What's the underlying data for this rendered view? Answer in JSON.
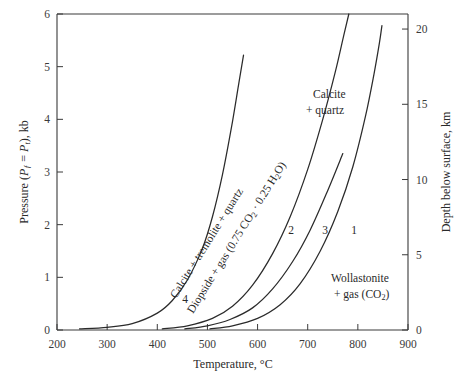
{
  "chart_data": {
    "type": "line",
    "title": "",
    "xlabel": "Temperature, °C",
    "ylabel": "Pressure (Pƒ = Pₜ), kb",
    "y2label": "Depth below surface, km",
    "xlim": [
      200,
      900
    ],
    "ylim": [
      0,
      6
    ],
    "y2lim": [
      0,
      21
    ],
    "xticks": [
      200,
      300,
      400,
      500,
      600,
      700,
      800,
      900
    ],
    "yticks": [
      0,
      1,
      2,
      3,
      4,
      5,
      6
    ],
    "y2ticks": [
      0,
      5,
      10,
      15,
      20
    ],
    "grid": false,
    "legend_position": "inline-annotations",
    "series": [
      {
        "name": "4",
        "label": "4",
        "label_x": 185,
        "label_y": 303,
        "points": [
          [
            245,
            0.02
          ],
          [
            300,
            0.05
          ],
          [
            350,
            0.12
          ],
          [
            400,
            0.32
          ],
          [
            430,
            0.56
          ],
          [
            460,
            0.95
          ],
          [
            490,
            1.55
          ],
          [
            510,
            2.15
          ],
          [
            530,
            2.95
          ],
          [
            548,
            3.85
          ],
          [
            562,
            4.65
          ],
          [
            572,
            5.22
          ]
        ]
      },
      {
        "name": "2",
        "label": "2",
        "label_x": 291,
        "label_y": 234,
        "points": [
          [
            410,
            0.02
          ],
          [
            460,
            0.08
          ],
          [
            510,
            0.22
          ],
          [
            550,
            0.45
          ],
          [
            590,
            0.85
          ],
          [
            630,
            1.45
          ],
          [
            665,
            2.15
          ],
          [
            700,
            3.05
          ],
          [
            730,
            4.0
          ],
          [
            755,
            4.9
          ],
          [
            772,
            5.6
          ],
          [
            782,
            6.0
          ]
        ]
      },
      {
        "name": "3",
        "label": "3",
        "label_x": 325,
        "label_y": 234,
        "points": [
          [
            455,
            0.02
          ],
          [
            500,
            0.08
          ],
          [
            545,
            0.2
          ],
          [
            590,
            0.42
          ],
          [
            630,
            0.78
          ],
          [
            670,
            1.3
          ],
          [
            705,
            1.9
          ],
          [
            740,
            2.65
          ],
          [
            770,
            3.35
          ]
        ]
      },
      {
        "name": "1",
        "label": "1",
        "label_x": 354,
        "label_y": 234,
        "points": [
          [
            505,
            0.02
          ],
          [
            550,
            0.08
          ],
          [
            600,
            0.22
          ],
          [
            645,
            0.48
          ],
          [
            685,
            0.88
          ],
          [
            725,
            1.5
          ],
          [
            760,
            2.25
          ],
          [
            790,
            3.1
          ],
          [
            815,
            4.05
          ],
          [
            832,
            4.85
          ],
          [
            843,
            5.45
          ],
          [
            848,
            5.78
          ]
        ]
      }
    ],
    "annotations": [
      {
        "name": "calcite-tremolite-quartz",
        "text": "Calcite + tremolite + quartz",
        "rotated": true,
        "x": 176,
        "y": 299,
        "angle": -58
      },
      {
        "name": "diopside-gas",
        "text_plain": "Diopside + gas (0.75 CO2 · 0.25 H2O)",
        "parts": [
          "Diopside + gas (0.75 CO",
          "2",
          " · 0.25 H",
          "2",
          "O)"
        ],
        "rotated": true,
        "x": 191,
        "y": 312,
        "angle": -58
      },
      {
        "name": "calcite-quartz",
        "lines": [
          "Calcite",
          "+ quartz"
        ],
        "x": 313,
        "y": 98
      },
      {
        "name": "wollastonite-gas",
        "lines": [
          "Wollastonite",
          "+  gas (CO",
          "2",
          ")"
        ],
        "line1": "Wollastonite",
        "line2_pre": "+  gas (CO",
        "line2_sub": "2",
        "line2_post": ")",
        "x": 331,
        "y": 278
      }
    ]
  },
  "axes": {
    "left": {
      "title_main": "Pressure (",
      "title_pf": "P",
      "title_pf_sub": "ƒ",
      "title_eq": " = ",
      "title_pt": "P",
      "title_pt_sub": "t",
      "title_tail": "), kb",
      "ticklabels": [
        "6",
        "5",
        "4",
        "3",
        "2",
        "1",
        "0"
      ]
    },
    "bottom": {
      "title_pre": "Temperature, ",
      "title_unit": "°C",
      "ticklabels": [
        "200",
        "300",
        "400",
        "500",
        "600",
        "700",
        "800",
        "900"
      ]
    },
    "right": {
      "title": "Depth below surface, km",
      "ticklabels": [
        "20",
        "15",
        "10",
        "5",
        "0"
      ]
    }
  },
  "style": {
    "curve_color": "#2b2b2b",
    "axis_color": "#3a3a3a",
    "text_color": "#2a2a2a",
    "background": "#ffffff"
  }
}
